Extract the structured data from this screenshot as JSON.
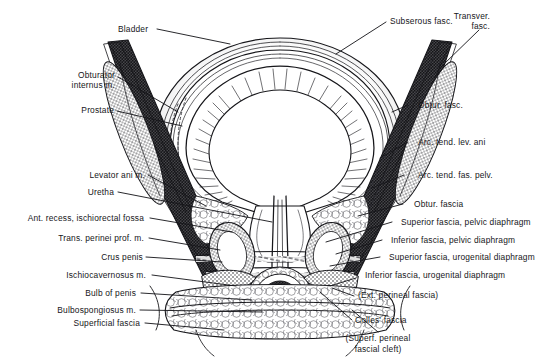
{
  "figure": {
    "type": "anatomical-illustration",
    "background_color": "#ffffff",
    "ink_color": "#16161a",
    "structures": {
      "bladder": "concentric layered vesical wall with radial muscular hatching",
      "prostate": "shaded mass below bladder neck",
      "urethra": "narrow vertical channel descending through prostate and urogenital diaphragm",
      "pelvic_wall": "dense stippled obturator internus band on each side",
      "ischiorectal_fossa": "open reticular fat space lateral to levator ani",
      "crus_penis": "paired oval erectile bodies",
      "bulb_of_penis": "central bulbar mass at base"
    }
  },
  "labels": {
    "bladder": "Bladder",
    "subserous_fasc": "Subserous fasc.",
    "transver_fasc_l1": "Transver.",
    "transver_fasc_l2": "fasc.",
    "obturator_internus_l1": "Obturator",
    "obturator_internus_l2": "internus m.",
    "prostate": "Prostate",
    "levator_ani": "Levator ani m.",
    "uretha": "Uretha",
    "ant_recess": "Ant. recess, ischiorectal fossa",
    "trans_perinei": "Trans. perinei prof. m.",
    "crus_penis": "Crus penis",
    "ischiocavernosus": "Ischiocavernosus m.",
    "bulb_of_penis": "Bulb of penis",
    "bulbospongiosus": "Bulbospongiosus m.",
    "superficial_fascia": "Superficial fascia",
    "obtur_fasc": "Obtur. fasc.",
    "arc_tend_lev_ani": "Arc. tend. lev. ani",
    "arc_tend_fas_pelv": "Arc. tend. fas. pelv.",
    "obtur_fascia": "Obtur. fascia",
    "sup_fascia_pelvic": "Superior fascia, pelvic diaphragm",
    "inf_fascia_pelvic": "Inferior fascia, pelvic diaphragm",
    "sup_fascia_urogenital": "Superior fascia, urogenital diaphragm",
    "inf_fascia_urogenital": "Inferior fascia, urogenital diaphragm",
    "ext_perineal_fascia": "(Ext. perineal fascia)",
    "colles_fascia": "Colles' fascia",
    "superf_cleft_l1": "(Superf. perineal",
    "superf_cleft_l2": "fascial cleft)"
  }
}
